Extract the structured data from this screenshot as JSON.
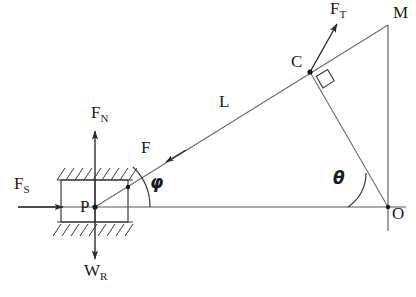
{
  "figure": {
    "canvas": {
      "width": 416,
      "height": 297
    },
    "stroke_color": "#2b2b2b",
    "background_color": "#ffffff"
  },
  "points": [
    {
      "id": "P",
      "label": "P",
      "x": 95,
      "y": 207,
      "label_x": 80,
      "label_y": 198
    },
    {
      "id": "C",
      "label": "C",
      "x": 310,
      "y": 72,
      "label_x": 291,
      "label_y": 53
    },
    {
      "id": "M",
      "label": "M",
      "x": 388,
      "y": 25,
      "label_x": 393,
      "label_y": 4
    },
    {
      "id": "O",
      "label": "O",
      "x": 388,
      "y": 207,
      "label_x": 392,
      "label_y": 205
    }
  ],
  "forces": [
    {
      "id": "FS",
      "base": "F",
      "sub": "S",
      "description": "static friction force, horizontal pointing right into block",
      "label_x": 14,
      "label_y": 175
    },
    {
      "id": "FN",
      "base": "F",
      "sub": "N",
      "description": "normal force, vertical pointing up from P",
      "label_x": 91,
      "label_y": 104
    },
    {
      "id": "WR",
      "base": "W",
      "sub": "R",
      "description": "weight, vertical pointing down from P",
      "label_x": 84,
      "label_y": 262
    },
    {
      "id": "F",
      "base": "F",
      "sub": "",
      "description": "applied cable force at P directed along line L toward P",
      "label_x": 141,
      "label_y": 139
    },
    {
      "id": "FT",
      "base": "F",
      "sub": "T",
      "description": "tension force at C pointing up and to the right",
      "label_x": 330,
      "label_y": 0
    }
  ],
  "segments": [
    {
      "id": "L",
      "label": "L",
      "description": "cable length from P through C to M",
      "label_x": 219,
      "label_y": 93
    }
  ],
  "angles": [
    {
      "id": "phi",
      "label": "φ",
      "description": "angle at P between horizontal baseline and cable L",
      "label_x": 150,
      "label_y": 174
    },
    {
      "id": "theta",
      "label": "θ",
      "description": "angle at O between horizontal baseline and line C-O",
      "label_x": 333,
      "label_y": 170
    }
  ],
  "markers": [
    {
      "id": "right-angle-at-C",
      "label": "right angle between cable L and line C-O at point C"
    }
  ],
  "block": {
    "id": "hatched-block",
    "description": "rectangular block with hatched (fixed) surfaces above and below",
    "x": 61,
    "y": 180,
    "width": 67,
    "height": 42
  }
}
